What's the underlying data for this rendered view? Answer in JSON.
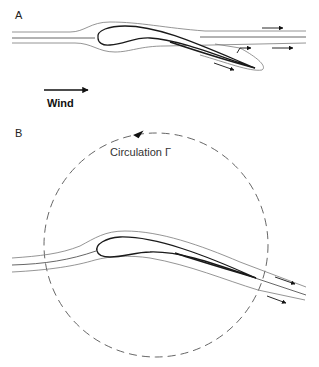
{
  "figure": {
    "panel_a": {
      "label": "A",
      "wind_label": "Wind"
    },
    "panel_b": {
      "label": "B",
      "circulation_label": "Circulation  Γ"
    },
    "colors": {
      "airfoil": "#1a1a1a",
      "streamline": "#7a7a7a",
      "arrow": "#111111",
      "circle": "#555555",
      "background": "#ffffff"
    }
  }
}
